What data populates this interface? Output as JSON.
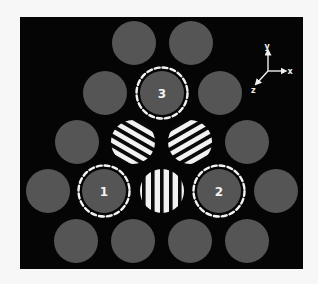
{
  "figure": {
    "background": "#f7f7f7",
    "panel": {
      "x": 20,
      "y": 17,
      "width": 283,
      "height": 252,
      "fill": "#050505"
    },
    "colors": {
      "gray_element": "#555555",
      "stripe_light": "#f2f2f2",
      "stripe_dark": "#0a0a0a",
      "dashed_ring": "#f2f2f2",
      "label": "#f2f2f2"
    },
    "element_radius": 22,
    "ring_radius": 25.5,
    "gray_elements": [
      {
        "cx": 134,
        "cy": 43
      },
      {
        "cx": 191,
        "cy": 43
      },
      {
        "cx": 105,
        "cy": 93
      },
      {
        "cx": 220,
        "cy": 93
      },
      {
        "cx": 77,
        "cy": 142
      },
      {
        "cx": 247,
        "cy": 142
      },
      {
        "cx": 48,
        "cy": 191
      },
      {
        "cx": 276,
        "cy": 191
      },
      {
        "cx": 76,
        "cy": 241
      },
      {
        "cx": 133,
        "cy": 241
      },
      {
        "cx": 190,
        "cy": 241
      },
      {
        "cx": 247,
        "cy": 241
      }
    ],
    "marked_elements": [
      {
        "label": "1",
        "cx": 104,
        "cy": 191
      },
      {
        "label": "2",
        "cx": 219,
        "cy": 191
      },
      {
        "label": "3",
        "cx": 162,
        "cy": 93
      }
    ],
    "striped_elements": [
      {
        "name": "striped-element-left-diagonal",
        "cx": 133,
        "cy": 142,
        "angle": 30,
        "orientation": "diagonal-descending"
      },
      {
        "name": "striped-element-right-diagonal",
        "cx": 190,
        "cy": 142,
        "angle": -30,
        "orientation": "diagonal-ascending"
      },
      {
        "name": "striped-element-vertical",
        "cx": 162,
        "cy": 191,
        "angle": 90,
        "orientation": "vertical"
      }
    ],
    "axes": {
      "origin": {
        "x": 268,
        "y": 71
      },
      "labels": {
        "x": "x",
        "y": "y",
        "z": "z"
      }
    }
  }
}
